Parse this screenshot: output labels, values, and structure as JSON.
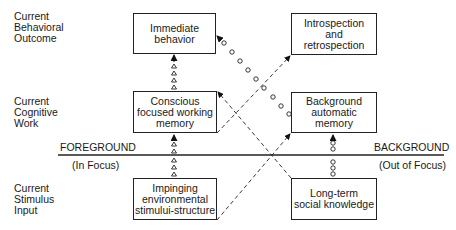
{
  "row_labels": {
    "behavioral": [
      "Current",
      "Behavioral",
      "Outcome"
    ],
    "cognitive": [
      "Current",
      "Cognitive",
      "Work"
    ],
    "stimulus": [
      "Current",
      "Stimulus",
      "Input"
    ]
  },
  "boxes": {
    "immediate_behavior": [
      "Immediate",
      "behavior"
    ],
    "introspection": [
      "Introspection",
      "and",
      "retrospection"
    ],
    "conscious_memory": [
      "Conscious",
      "focused working",
      "memory"
    ],
    "background_memory": [
      "Background",
      "automatic",
      "memory"
    ],
    "impinging_stimuli": [
      "Impinging",
      "environmental",
      "stimului-structure"
    ],
    "long_term_knowledge": [
      "Long-term",
      "social knowledge"
    ]
  },
  "divider": {
    "foreground_label": "FOREGROUND",
    "foreground_sub": "(In Focus)",
    "background_label": "BACKGROUND",
    "background_sub": "(Out of Focus)"
  },
  "connectors": [
    {
      "from": "impinging_stimuli",
      "to": "conscious_memory",
      "style": "triangle-chain"
    },
    {
      "from": "conscious_memory",
      "to": "immediate_behavior",
      "style": "triangle-chain"
    },
    {
      "from": "long_term_knowledge",
      "to": "background_memory",
      "style": "circle-chain"
    },
    {
      "from": "background_memory",
      "to": "immediate_behavior",
      "style": "circle-chain"
    },
    {
      "from": "conscious_memory",
      "to": "introspection",
      "style": "dashed"
    },
    {
      "from": "impinging_stimuli",
      "to": "background_memory",
      "style": "dashed"
    },
    {
      "from": "long_term_knowledge",
      "to": "conscious_memory",
      "style": "dashed"
    }
  ]
}
